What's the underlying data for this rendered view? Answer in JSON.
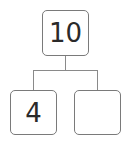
{
  "diagram": {
    "type": "number-bond",
    "whole": {
      "value": "10"
    },
    "parts": [
      {
        "value": "4"
      },
      {
        "value": ""
      }
    ],
    "colors": {
      "border": "#7a7a7a",
      "line": "#8a8a8a",
      "text": "#2a2a2a",
      "background": "#ffffff"
    }
  }
}
